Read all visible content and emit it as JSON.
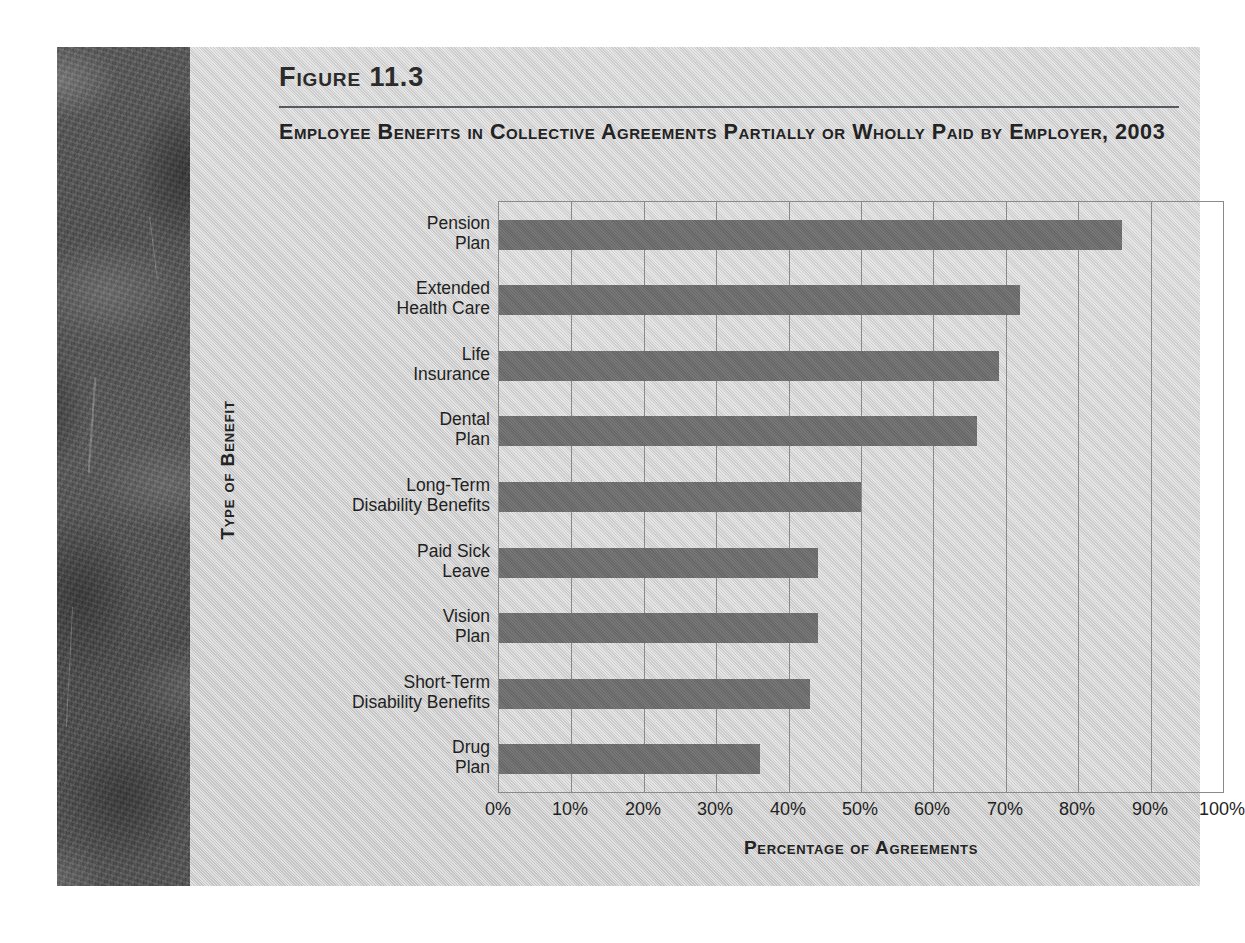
{
  "figure": {
    "number": "Figure 11.3",
    "title": "Employee Benefits in Collective Agreements Partially or Wholly Paid by Employer, 2003"
  },
  "chart_data": {
    "type": "bar",
    "orientation": "horizontal",
    "title": "Employee Benefits in Collective Agreements Partially or Wholly Paid by Employer, 2003",
    "xlabel": "Percentage of Agreements",
    "ylabel": "Type of Benefit",
    "categories": [
      "Pension\nPlan",
      "Extended\nHealth Care",
      "Life\nInsurance",
      "Dental\nPlan",
      "Long-Term\nDisability Benefits",
      "Paid Sick\nLeave",
      "Vision\nPlan",
      "Short-Term\nDisability Benefits",
      "Drug\nPlan"
    ],
    "values": [
      86,
      72,
      69,
      66,
      50,
      44,
      44,
      43,
      36
    ],
    "xlim": [
      0,
      100
    ],
    "xticks": [
      0,
      10,
      20,
      30,
      40,
      50,
      60,
      70,
      80,
      90,
      100
    ],
    "xtick_labels": [
      "0%",
      "10%",
      "20%",
      "30%",
      "40%",
      "50%",
      "60%",
      "70%",
      "80%",
      "90%",
      "100%"
    ],
    "grid": "vertical",
    "legend": "none",
    "bar_color": "#6d6d6d",
    "panel_color": "#cdcdcd",
    "axis_color": "#8a8a8a"
  }
}
